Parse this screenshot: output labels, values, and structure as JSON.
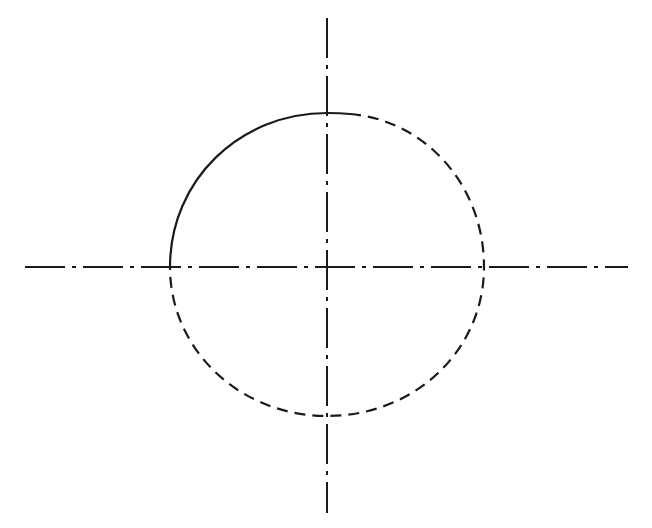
{
  "diagram": {
    "type": "technical-drawing",
    "background": "#ffffff",
    "stroke_color": "#1a1a1a",
    "center": [
      327,
      267
    ],
    "radius_x": 157,
    "radius_y": 152,
    "horizontal_centerline": {
      "x1": 25,
      "y": 267,
      "x2": 628,
      "style": "dash-dot"
    },
    "vertical_centerline": {
      "x": 327,
      "y1": 18,
      "y2": 513,
      "style": "dash-dot"
    },
    "solid_arc": {
      "from": [
        170,
        267
      ],
      "to": [
        350,
        114
      ],
      "style": "solid"
    },
    "dashed_arc": {
      "from": [
        350,
        114
      ],
      "to": [
        170,
        267
      ],
      "style": "dashed"
    }
  }
}
